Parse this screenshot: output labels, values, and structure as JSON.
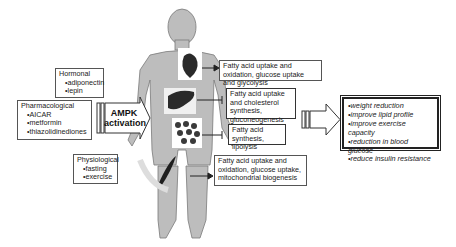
{
  "activators": {
    "hormonal": {
      "title": "Hormonal",
      "items": [
        "adiponectin",
        "lepin"
      ]
    },
    "pharmacological": {
      "title": "Pharmacological",
      "items": [
        "AICAR",
        "metformin",
        "thiazolidinediones"
      ]
    },
    "physiological": {
      "title": "Physiological",
      "items": [
        "fasting",
        "exercise"
      ]
    }
  },
  "ampk": {
    "line1": "AMPK",
    "line2": "activation"
  },
  "tissue_effects": {
    "heart": "Fatty acid uptake and oxidation, glucose uptake and glycolysis",
    "liver": "Fatty acid uptake and cholesterol synthesis, gluconeogenesis",
    "adipose": "Fatty acid synthesis, lipolysis",
    "muscle": "Fatty acid uptake and oxidation, glucose uptake, mitochondrial biogenesis"
  },
  "outcomes": [
    "weight reduction",
    "improve lipid profile",
    "improve exercise capacity",
    "reduction in blood glucose",
    "reduce insulin resistance"
  ],
  "colors": {
    "body": "#b8b8b8",
    "body_outline": "#7a7a7a",
    "organ": "#2a2a2a",
    "border": "#555555"
  }
}
